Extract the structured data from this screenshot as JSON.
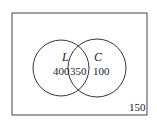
{
  "diagram": {
    "type": "venn",
    "universe_count": "150",
    "sets": [
      {
        "label": "L",
        "only_count": "400"
      },
      {
        "label": "C",
        "only_count": "100"
      }
    ],
    "intersection_count": "350",
    "colors": {
      "stroke": "#333333",
      "text": "#222222",
      "background": "#ffffff"
    }
  }
}
